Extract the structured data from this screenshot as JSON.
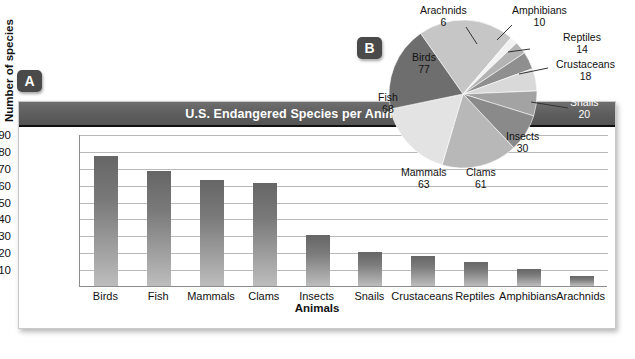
{
  "figure": {
    "panel_a_badge": "A",
    "panel_b_badge": "B"
  },
  "chart_data": [
    {
      "type": "bar",
      "title": "U.S. Endangered Species per Animal Group",
      "xlabel": "Animals",
      "ylabel": "Number of species",
      "categories": [
        "Birds",
        "Fish",
        "Mammals",
        "Clams",
        "Insects",
        "Snails",
        "Crustaceans",
        "Reptiles",
        "Amphibians",
        "Arachnids"
      ],
      "values": [
        77,
        68,
        63,
        61,
        30,
        20,
        18,
        14,
        10,
        6
      ],
      "yticks": [
        90,
        80,
        70,
        60,
        50,
        40,
        30,
        20,
        10
      ],
      "ylim": [
        0,
        90
      ],
      "grid": true,
      "legend": "none",
      "bar_color": "#7a7a7a"
    },
    {
      "type": "pie",
      "title": "",
      "labels": [
        "Birds",
        "Arachnids",
        "Amphibians",
        "Reptiles",
        "Crustaceans",
        "Snails",
        "Insects",
        "Clams",
        "Mammals",
        "Fish"
      ],
      "values": [
        77,
        6,
        10,
        14,
        18,
        20,
        30,
        61,
        63,
        68
      ],
      "total": 367,
      "legend": "labels-on-slices",
      "slice_colors": [
        "#c6c6c6",
        "#f2f2f2",
        "#b3b3b3",
        "#8f8f8f",
        "#d9d9d9",
        "#a3a3a3",
        "#8a8a8a",
        "#b8b8b8",
        "#e3e3e3",
        "#6e6e6e"
      ]
    }
  ],
  "pie_labels": {
    "birds": {
      "name": "Birds",
      "value": "77"
    },
    "arachnids": {
      "name": "Arachnids",
      "value": "6"
    },
    "amphibians": {
      "name": "Amphibians",
      "value": "10"
    },
    "reptiles": {
      "name": "Reptiles",
      "value": "14"
    },
    "crustaceans": {
      "name": "Crustaceans",
      "value": "18"
    },
    "snails": {
      "name": "Snails",
      "value": "20"
    },
    "insects": {
      "name": "Insects",
      "value": "30"
    },
    "clams": {
      "name": "Clams",
      "value": "61"
    },
    "mammals": {
      "name": "Mammals",
      "value": "63"
    },
    "fish": {
      "name": "Fish",
      "value": "68"
    }
  }
}
